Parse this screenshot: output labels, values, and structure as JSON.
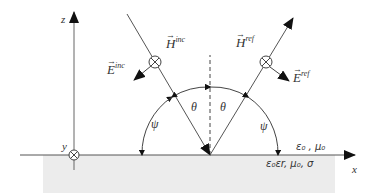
{
  "diagram": {
    "colors": {
      "line": "#444444",
      "ground": "#ececec",
      "text": "#333333"
    },
    "axes": {
      "z_label": "z",
      "x_label": "x",
      "y_label": "y"
    },
    "incident": {
      "H_label": "H",
      "H_sup": "inc",
      "E_label": "E",
      "E_sup": "inc"
    },
    "reflected": {
      "H_label": "H",
      "H_sup": "ref",
      "E_label": "E",
      "E_sup": "ref"
    },
    "angles": {
      "theta_left": "θ",
      "theta_right": "θ",
      "psi_left": "ψ",
      "psi_right": "ψ"
    },
    "media": {
      "upper": "ε₀ , μ₀",
      "lower": "ε₀εr, μ₀, σ"
    }
  }
}
